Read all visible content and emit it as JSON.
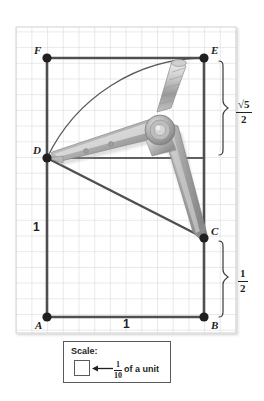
{
  "figure": {
    "background_color": "#ffffff",
    "grid_color": "#cfcfd4",
    "line_color": "#4a4a4a",
    "point_color": "#231f20",
    "grid_cell_label": "1/10 of a unit"
  },
  "points": [
    {
      "id": "A",
      "label": "A",
      "x": 0.0,
      "y": 0.0
    },
    {
      "id": "B",
      "label": "B",
      "x": 1.0,
      "y": 0.0
    },
    {
      "id": "C",
      "label": "C",
      "x": 1.0,
      "y": 0.5
    },
    {
      "id": "D",
      "label": "D",
      "x": 0.0,
      "y": 1.0
    },
    {
      "id": "E",
      "label": "E",
      "x": 1.0,
      "y": 1.618
    },
    {
      "id": "F",
      "label": "F",
      "x": 0.0,
      "y": 1.618
    }
  ],
  "segment_labels": [
    {
      "name": "left-side-length",
      "text": "1"
    },
    {
      "name": "bottom-side-length",
      "text": "1"
    }
  ],
  "measure_labels": [
    {
      "name": "sqrt5-over-2",
      "numerator": "√5",
      "denominator": "2",
      "spans": "E down to D level"
    },
    {
      "name": "one-half",
      "numerator": "1",
      "denominator": "2",
      "spans": "C down to B"
    }
  ],
  "legend": {
    "title": "Scale:",
    "arrow_icon": "left-arrow-icon",
    "fraction_numerator": "1",
    "fraction_denominator": "10",
    "unit_text": "of a unit"
  },
  "tool": {
    "name": "compass",
    "description": "drafting compass with pivot hinge, knurled handle, point leg at D and pencil leg at C"
  }
}
